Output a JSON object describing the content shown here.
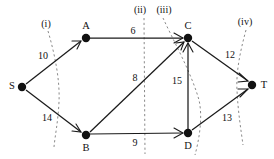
{
  "diagram": {
    "type": "directed-weighted-graph-with-cuts",
    "title": "",
    "colors": {
      "node": "#111111",
      "edge": "#1a1a1a",
      "cut": "#8a8a8a",
      "background": "#ffffff"
    },
    "nodes": [
      {
        "id": "S",
        "label": "S",
        "x": 22,
        "y": 87,
        "label_x": 12,
        "label_y": 86
      },
      {
        "id": "A",
        "label": "A",
        "x": 86,
        "y": 38,
        "label_x": 86,
        "label_y": 26
      },
      {
        "id": "B",
        "label": "B",
        "x": 86,
        "y": 135,
        "label_x": 86,
        "label_y": 148
      },
      {
        "id": "C",
        "label": "C",
        "x": 188,
        "y": 38,
        "label_x": 188,
        "label_y": 26
      },
      {
        "id": "D",
        "label": "D",
        "x": 188,
        "y": 133,
        "label_x": 188,
        "label_y": 146
      },
      {
        "id": "T",
        "label": "T",
        "x": 252,
        "y": 85,
        "label_x": 264,
        "label_y": 85
      }
    ],
    "edges": [
      {
        "from": "S",
        "to": "A",
        "weight": "10",
        "label_x": 43,
        "label_y": 56
      },
      {
        "from": "S",
        "to": "B",
        "weight": "14",
        "label_x": 47,
        "label_y": 118
      },
      {
        "from": "A",
        "to": "C",
        "weight": "6",
        "label_x": 133,
        "label_y": 31
      },
      {
        "from": "B",
        "to": "C",
        "weight": "8",
        "label_x": 135,
        "label_y": 78
      },
      {
        "from": "B",
        "to": "D",
        "weight": "9",
        "label_x": 135,
        "label_y": 143
      },
      {
        "from": "D",
        "to": "C",
        "weight": "15",
        "label_x": 177,
        "label_y": 81
      },
      {
        "from": "C",
        "to": "T",
        "weight": "12",
        "label_x": 230,
        "label_y": 55
      },
      {
        "from": "D",
        "to": "T",
        "weight": "13",
        "label_x": 227,
        "label_y": 118
      }
    ],
    "cuts": [
      {
        "id": "i",
        "label": "(i)",
        "label_x": 46,
        "label_y": 24
      },
      {
        "id": "ii",
        "label": "(ii)",
        "label_x": 140,
        "label_y": 10
      },
      {
        "id": "iii",
        "label": "(iii)",
        "label_x": 164,
        "label_y": 10
      },
      {
        "id": "iv",
        "label": "(iv)",
        "label_x": 245,
        "label_y": 22
      }
    ]
  }
}
